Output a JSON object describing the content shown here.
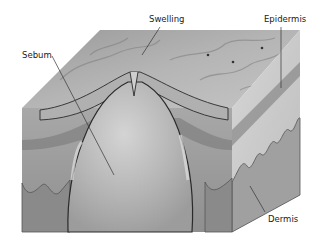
{
  "diagram": {
    "type": "anatomical cross-section",
    "labels": [
      {
        "id": "swelling",
        "text": "Swelling",
        "x": 149,
        "y": 15
      },
      {
        "id": "epidermis",
        "text": "Epidermis",
        "x": 264,
        "y": 15
      },
      {
        "id": "sebum",
        "text": "Sebum",
        "x": 22,
        "y": 51
      },
      {
        "id": "dermis",
        "text": "Dermis",
        "x": 268,
        "y": 215
      }
    ],
    "colors": {
      "background": "#ffffff",
      "top_face": "#a9a9a9",
      "front_face": "#9a9a9a",
      "right_face": "#c8c8c8",
      "sebum": "#b8b8b8",
      "outline": "#2a2a2a",
      "leader": "#333333"
    }
  }
}
